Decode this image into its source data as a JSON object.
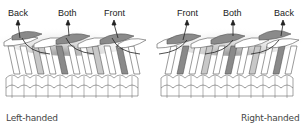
{
  "left_panel": {
    "caption": "Left-handed",
    "labels": [
      "Back",
      "Both",
      "Front"
    ]
  },
  "right_panel": {
    "caption": "Right-handed",
    "labels": [
      "Front",
      "Both",
      "Back"
    ]
  },
  "colors": {
    "highlight_dark": "#8a8a8a",
    "highlight_light": "#c8c8c8",
    "outline": "#555555",
    "background": "#ffffff"
  }
}
